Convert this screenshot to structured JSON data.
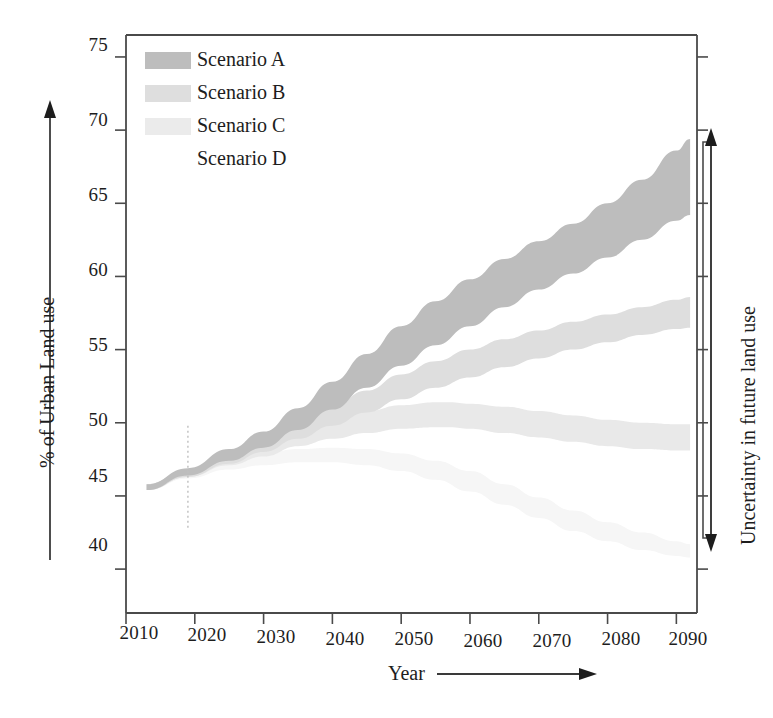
{
  "chart_data": {
    "type": "area",
    "title": "",
    "subtitle": "",
    "xlabel": "Year",
    "ylabel": "% of Urban Land use",
    "xlim": [
      2010,
      2093
    ],
    "ylim": [
      37,
      76.5
    ],
    "grid": false,
    "legend_position": "top-left inside plot",
    "x_ticks": [
      "2010",
      "2020",
      "2030",
      "2040",
      "2050",
      "2060",
      "2070",
      "2080",
      "2090"
    ],
    "x_tick_values": [
      2010,
      2020,
      2030,
      2040,
      2050,
      2060,
      2070,
      2080,
      2090
    ],
    "y_ticks": [
      "40",
      "45",
      "50",
      "55",
      "60",
      "65",
      "70",
      "75"
    ],
    "y_tick_values": [
      40,
      45,
      50,
      55,
      60,
      65,
      70,
      75
    ],
    "legend": [
      "Scenario A",
      "Scenario B",
      "Scenario C",
      "Scenario D"
    ],
    "annotations": [
      {
        "name": "uncertainty-bracket",
        "text": "Uncertainty in future land use",
        "y_range": [
          41.0,
          69.5
        ]
      },
      {
        "name": "reference-year-line",
        "text": "",
        "x": 2019,
        "style": "dotted vertical"
      }
    ],
    "series": [
      {
        "name": "Scenario A",
        "color": "#bdbdbd",
        "kind": "uncertainty-band",
        "x": [
          2013,
          2019,
          2025,
          2030,
          2035,
          2040,
          2045,
          2050,
          2055,
          2060,
          2065,
          2070,
          2075,
          2080,
          2085,
          2090,
          2092
        ],
        "upper": [
          45.8,
          46.9,
          48.2,
          49.4,
          51.0,
          52.8,
          54.7,
          56.6,
          58.3,
          59.8,
          61.2,
          62.4,
          63.6,
          65.0,
          66.6,
          68.6,
          69.4
        ],
        "lower": [
          45.4,
          46.4,
          47.4,
          48.3,
          49.5,
          50.9,
          52.4,
          53.9,
          55.3,
          56.6,
          57.9,
          59.1,
          60.2,
          61.3,
          62.5,
          63.8,
          64.2
        ]
      },
      {
        "name": "Scenario B",
        "color": "#dedede",
        "kind": "uncertainty-band",
        "x": [
          2013,
          2019,
          2025,
          2030,
          2035,
          2040,
          2045,
          2050,
          2055,
          2060,
          2065,
          2070,
          2075,
          2080,
          2085,
          2090,
          2092
        ],
        "upper": [
          45.8,
          46.8,
          47.9,
          48.9,
          50.0,
          51.1,
          52.2,
          53.3,
          54.2,
          55.0,
          55.7,
          56.3,
          56.9,
          57.4,
          57.9,
          58.4,
          58.6
        ],
        "lower": [
          45.4,
          46.3,
          47.2,
          48.0,
          48.9,
          49.8,
          50.7,
          51.6,
          52.4,
          53.1,
          53.8,
          54.4,
          55.0,
          55.5,
          56.0,
          56.4,
          56.5
        ]
      },
      {
        "name": "Scenario C",
        "color": "#e9e9e9",
        "kind": "uncertainty-band",
        "x": [
          2013,
          2019,
          2025,
          2030,
          2035,
          2040,
          2045,
          2050,
          2055,
          2057,
          2060,
          2065,
          2070,
          2075,
          2080,
          2085,
          2090,
          2092
        ],
        "upper": [
          45.8,
          46.8,
          47.8,
          48.6,
          49.5,
          50.2,
          50.8,
          51.2,
          51.4,
          51.4,
          51.3,
          51.1,
          50.8,
          50.5,
          50.2,
          50.0,
          49.9,
          49.9
        ],
        "lower": [
          45.4,
          46.3,
          47.1,
          47.7,
          48.4,
          48.9,
          49.3,
          49.6,
          49.7,
          49.7,
          49.6,
          49.3,
          49.0,
          48.7,
          48.4,
          48.2,
          48.1,
          48.1
        ]
      },
      {
        "name": "Scenario D",
        "color": "#f6f6f6",
        "kind": "uncertainty-band",
        "x": [
          2013,
          2019,
          2025,
          2030,
          2035,
          2040,
          2045,
          2050,
          2055,
          2060,
          2065,
          2070,
          2075,
          2080,
          2085,
          2090,
          2092
        ],
        "upper": [
          45.8,
          46.7,
          47.4,
          47.9,
          48.2,
          48.3,
          48.2,
          47.9,
          47.4,
          46.7,
          45.8,
          44.9,
          44.0,
          43.2,
          42.5,
          41.9,
          41.7
        ],
        "lower": [
          45.4,
          46.2,
          46.8,
          47.1,
          47.3,
          47.3,
          47.1,
          46.7,
          46.1,
          45.3,
          44.4,
          43.5,
          42.6,
          41.9,
          41.3,
          40.9,
          40.8
        ]
      }
    ]
  },
  "axes": {
    "y_title": "% of Urban Land use",
    "x_title": "Year"
  },
  "legend": {
    "items": [
      {
        "label": "Scenario A",
        "color": "#bdbdbd"
      },
      {
        "label": "Scenario B",
        "color": "#dedede"
      },
      {
        "label": "Scenario C",
        "color": "#ebebeb"
      },
      {
        "label": "Scenario D",
        "color": "#ffffff"
      }
    ]
  },
  "right_annotation": {
    "text": "Uncertainty in future land use"
  },
  "ticks": {
    "y": [
      "75",
      "70",
      "65",
      "60",
      "55",
      "50",
      "45",
      "40"
    ],
    "x": [
      "2010",
      "2020",
      "2030",
      "2040",
      "2050",
      "2060",
      "2070",
      "2080",
      "2090"
    ]
  }
}
